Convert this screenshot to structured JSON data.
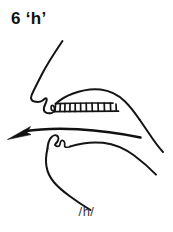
{
  "figure": {
    "number": "6",
    "title": "6 ‘h’",
    "caption": "/h/",
    "diagram_name": "sagittal-vocal-tract",
    "ink_color": "#141414",
    "background_color": "#ffffff",
    "parts": [
      "nose-profile",
      "upper-lip",
      "upper-teeth",
      "hard-palate",
      "soft-palate",
      "pharyngeal-wall",
      "lower-lip",
      "lower-teeth",
      "tongue",
      "jaw-chin-line",
      "airflow-arrow"
    ]
  },
  "annotations": {
    "airflow_direction": "leftward-outward"
  }
}
